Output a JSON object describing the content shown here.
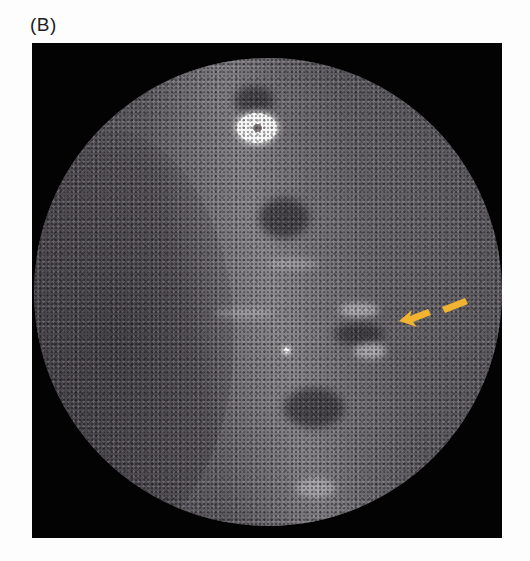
{
  "figure": {
    "panel_label": "(B)",
    "image_type": "cone-beam CT cross-sectional slice (grayscale, circular field of view)",
    "annotations": [
      {
        "type": "arrow",
        "color": "#f2b430",
        "direction": "pointing left-down",
        "target": "bony defect / lesion region"
      }
    ],
    "colors": {
      "background": "#fdfdfd",
      "frame": "#030303",
      "tissue_gray": "#625f64",
      "arrow_yellow": "#f2b430"
    }
  }
}
